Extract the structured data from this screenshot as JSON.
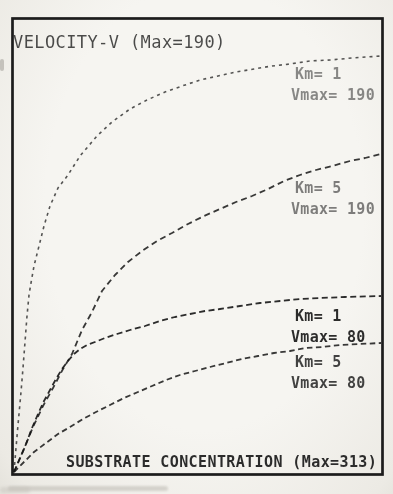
{
  "page": {
    "kind": "scanned dot-matrix printout of an enzyme kinetics plot"
  },
  "chart_data": {
    "type": "line",
    "title": "VELOCITY-V (Max=190)",
    "xlabel": "SUBSTRATE CONCENTRATION (Max=313)",
    "ylabel": "VELOCITY-V",
    "x_range": [
      0,
      313
    ],
    "y_range": [
      0,
      190
    ],
    "grid": false,
    "legend_position": "inline-right",
    "series": [
      {
        "name": "Km=1 Vmax=190",
        "km": 1,
        "vmax": 190,
        "label": {
          "x": 295,
          "y": 64,
          "lines": [
            "Km= 1",
            "Vmax= 190"
          ],
          "opacity": 0.5
        },
        "stroke": {
          "dash": "3 4",
          "width": 1.6,
          "opacity": 0.72
        },
        "px_points": [
          [
            14,
            472
          ],
          [
            16,
            448
          ],
          [
            18,
            425
          ],
          [
            21,
            392
          ],
          [
            23,
            368
          ],
          [
            25,
            342
          ],
          [
            27,
            316
          ],
          [
            29,
            295
          ],
          [
            31,
            283
          ],
          [
            34,
            266
          ],
          [
            38,
            250
          ],
          [
            44,
            226
          ],
          [
            50,
            206
          ],
          [
            58,
            188
          ],
          [
            68,
            175
          ],
          [
            80,
            156
          ],
          [
            97,
            136
          ],
          [
            112,
            122
          ],
          [
            130,
            109
          ],
          [
            147,
            100
          ],
          [
            165,
            92
          ],
          [
            182,
            86
          ],
          [
            200,
            80
          ],
          [
            218,
            76
          ],
          [
            236,
            72
          ],
          [
            254,
            69
          ],
          [
            272,
            66
          ],
          [
            290,
            64
          ],
          [
            310,
            61
          ],
          [
            330,
            60
          ],
          [
            352,
            58
          ],
          [
            381,
            56
          ]
        ]
      },
      {
        "name": "Km=5 Vmax=190",
        "km": 5,
        "vmax": 190,
        "label": {
          "x": 295,
          "y": 178,
          "lines": [
            "Km= 5",
            "Vmax= 190"
          ],
          "opacity": 0.55
        },
        "stroke": {
          "dash": "6 4",
          "width": 1.8,
          "opacity": 0.85
        },
        "px_points": [
          [
            14,
            472
          ],
          [
            24,
            449
          ],
          [
            33,
            427
          ],
          [
            43,
            406
          ],
          [
            53,
            388
          ],
          [
            63,
            369
          ],
          [
            72,
            354
          ],
          [
            82,
            330
          ],
          [
            92,
            312
          ],
          [
            102,
            291
          ],
          [
            115,
            275
          ],
          [
            128,
            262
          ],
          [
            142,
            251
          ],
          [
            157,
            241
          ],
          [
            172,
            233
          ],
          [
            188,
            224
          ],
          [
            204,
            216
          ],
          [
            220,
            209
          ],
          [
            236,
            202
          ],
          [
            252,
            196
          ],
          [
            268,
            189
          ],
          [
            284,
            181
          ],
          [
            300,
            175
          ],
          [
            316,
            170
          ],
          [
            332,
            166
          ],
          [
            350,
            161
          ],
          [
            365,
            158
          ],
          [
            381,
            154
          ]
        ]
      },
      {
        "name": "Km=1 Vmax=80",
        "km": 1,
        "vmax": 80,
        "label": {
          "x": 295,
          "y": 306,
          "lines": [
            "Km= 1",
            "Vmax= 80"
          ],
          "opacity": 0.92
        },
        "stroke": {
          "dash": "6 3.5",
          "width": 1.8,
          "opacity": 0.9
        },
        "px_points": [
          [
            14,
            472
          ],
          [
            20,
            458
          ],
          [
            26,
            444
          ],
          [
            32,
            428
          ],
          [
            38,
            414
          ],
          [
            44,
            401
          ],
          [
            50,
            390
          ],
          [
            56,
            379
          ],
          [
            62,
            369
          ],
          [
            68,
            361
          ],
          [
            74,
            354
          ],
          [
            80,
            349
          ],
          [
            87,
            345
          ],
          [
            95,
            342
          ],
          [
            105,
            338
          ],
          [
            117,
            334
          ],
          [
            130,
            330
          ],
          [
            145,
            326
          ],
          [
            160,
            321
          ],
          [
            175,
            317
          ],
          [
            190,
            314
          ],
          [
            205,
            311
          ],
          [
            220,
            309
          ],
          [
            240,
            306
          ],
          [
            260,
            303
          ],
          [
            280,
            301
          ],
          [
            300,
            299
          ],
          [
            320,
            298
          ],
          [
            345,
            297
          ],
          [
            381,
            296
          ]
        ]
      },
      {
        "name": "Km=5 Vmax=80",
        "km": 5,
        "vmax": 80,
        "label": {
          "x": 295,
          "y": 352,
          "lines": [
            "Km= 5",
            "Vmax= 80"
          ],
          "opacity": 0.82
        },
        "stroke": {
          "dash": "5.5 3.5",
          "width": 1.8,
          "opacity": 0.85
        },
        "px_points": [
          [
            14,
            472
          ],
          [
            24,
            462
          ],
          [
            34,
            452
          ],
          [
            46,
            443
          ],
          [
            58,
            434
          ],
          [
            70,
            427
          ],
          [
            83,
            419
          ],
          [
            96,
            412
          ],
          [
            110,
            405
          ],
          [
            124,
            398
          ],
          [
            138,
            392
          ],
          [
            152,
            386
          ],
          [
            166,
            380
          ],
          [
            180,
            375
          ],
          [
            195,
            371
          ],
          [
            210,
            367
          ],
          [
            226,
            363
          ],
          [
            242,
            359
          ],
          [
            258,
            356
          ],
          [
            274,
            353
          ],
          [
            290,
            351
          ],
          [
            306,
            348
          ],
          [
            322,
            347
          ],
          [
            340,
            345
          ],
          [
            360,
            344
          ],
          [
            381,
            343
          ]
        ]
      }
    ]
  },
  "plot": {
    "frame": {
      "x": 12.5,
      "y": 18.5,
      "w": 370,
      "h": 456
    },
    "canvas": {
      "w": 393,
      "h": 494
    }
  },
  "colors": {
    "ink": "#1b1b1b",
    "paper": "#f2f0eb"
  }
}
